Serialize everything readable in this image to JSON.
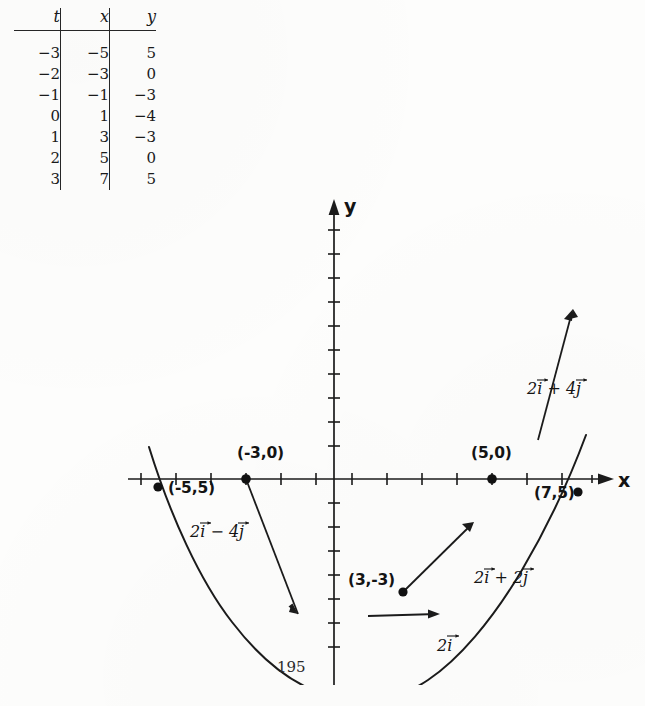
{
  "page": {
    "number": "195"
  },
  "table": {
    "headers": [
      "t",
      "x",
      "y"
    ],
    "rows": [
      [
        "−3",
        "−5",
        "5"
      ],
      [
        "−2",
        "−3",
        "0"
      ],
      [
        "−1",
        "−1",
        "−3"
      ],
      [
        "0",
        "1",
        "−4"
      ],
      [
        "1",
        "3",
        "−3"
      ],
      [
        "2",
        "5",
        "0"
      ],
      [
        "3",
        "7",
        "5"
      ]
    ]
  },
  "chart_data": {
    "type": "line",
    "title": "",
    "xlabel": "x",
    "ylabel": "y",
    "grid": false,
    "legend": null,
    "xlim": [
      -7,
      9
    ],
    "ylim": [
      -5,
      7
    ],
    "curve_description": "Parabola through the parametric points (x,y) = (2t+1, t^2-4)",
    "parametric": {
      "x": "2t + 1",
      "y": "t^2 - 4"
    },
    "points": [
      {
        "t": "-3",
        "x": -5,
        "y": 5,
        "label": "(-5,5)",
        "marked": true
      },
      {
        "t": "-2",
        "x": -3,
        "y": 0,
        "label": "(-3,0)",
        "marked": true
      },
      {
        "t": "-1",
        "x": -1,
        "y": -3,
        "label": "",
        "marked": false
      },
      {
        "t": "0",
        "x": 1,
        "y": -4,
        "label": "(1,-4)",
        "marked": true
      },
      {
        "t": "1",
        "x": 3,
        "y": -3,
        "label": "(3,-3)",
        "marked": true
      },
      {
        "t": "2",
        "x": 5,
        "y": 0,
        "label": "(5,0)",
        "marked": true
      },
      {
        "t": "3",
        "x": 7,
        "y": 5,
        "label": "(7,5)",
        "marked": true
      }
    ],
    "tangent_vectors": [
      {
        "at_point": "(-3,0)",
        "label": "2i - 4j",
        "dx": 2,
        "dy": -4
      },
      {
        "at_point": "(1,-4)",
        "label": "2i",
        "dx": 2,
        "dy": 0
      },
      {
        "at_point": "(3,-3)",
        "label": "2i + 2j",
        "dx": 2,
        "dy": 2
      },
      {
        "at_point": "(7,5)",
        "label": "2i + 4j",
        "dx": 2,
        "dy": 4
      }
    ]
  },
  "axes": {
    "x_label": "x",
    "y_label": "y"
  },
  "annotations": {
    "p_neg5_5": "(-5,5)",
    "p_neg3_0": "(-3,0)",
    "p_1_neg4": "(1,-4)",
    "p_3_neg3": "(3,-3)",
    "p_5_0": "(5,0)",
    "p_7_5": "(7,5)",
    "v_2i_minus_4j_a": "2",
    "v_2i_minus_4j_b": "i",
    "v_2i_minus_4j_op": " − ",
    "v_2i_minus_4j_c": "4",
    "v_2i_minus_4j_d": "j",
    "v_2i_a": "2",
    "v_2i_b": "i",
    "v_2i_plus_2j_a": "2",
    "v_2i_plus_2j_b": "i",
    "v_2i_plus_2j_op": " + ",
    "v_2i_plus_2j_c": "2",
    "v_2i_plus_2j_d": "j",
    "v_2i_plus_4j_a": "2",
    "v_2i_plus_4j_b": "i",
    "v_2i_plus_4j_op": " + ",
    "v_2i_plus_4j_c": "4",
    "v_2i_plus_4j_d": "j"
  }
}
